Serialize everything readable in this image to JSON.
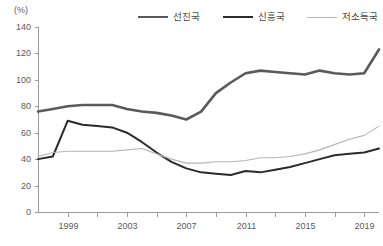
{
  "axis": {
    "unit_label": "(%)",
    "y_ticks": [
      "0",
      "20",
      "40",
      "60",
      "80",
      "100",
      "120",
      "140"
    ],
    "x_ticks": [
      "1999",
      "2003",
      "2007",
      "2011",
      "2015",
      "2019"
    ]
  },
  "legend": {
    "entries": [
      {
        "label": "선진국",
        "color": "#5a5a5a",
        "width": 2.6,
        "icon": "line-swatch-icon"
      },
      {
        "label": "신흥국",
        "color": "#2b2b2b",
        "width": 2.6,
        "icon": "line-swatch-icon"
      },
      {
        "label": "저소득국",
        "color": "#b5b5b5",
        "width": 1.1,
        "icon": "line-swatch-icon"
      }
    ]
  },
  "chart_data": {
    "type": "line",
    "title": "",
    "subtitle": "",
    "xlabel": "",
    "ylabel": "(%)",
    "xlim": [
      1997,
      2020
    ],
    "ylim": [
      0,
      140
    ],
    "grid": false,
    "legend_position": "top",
    "x": [
      1997,
      1998,
      1999,
      2000,
      2001,
      2002,
      2003,
      2004,
      2005,
      2006,
      2007,
      2008,
      2009,
      2010,
      2011,
      2012,
      2013,
      2014,
      2015,
      2016,
      2017,
      2018,
      2019,
      2020
    ],
    "x_tick_values": [
      1999,
      2003,
      2007,
      2011,
      2015,
      2019
    ],
    "x_minor_tick_values": [
      1999,
      2001,
      2003,
      2005,
      2007,
      2009,
      2011,
      2013,
      2015,
      2017,
      2019
    ],
    "y_tick_values": [
      0,
      20,
      40,
      60,
      80,
      100,
      120,
      140
    ],
    "series": [
      {
        "name": "선진국",
        "color": "#5a5a5a",
        "width": 2.6,
        "values": [
          76,
          78,
          80,
          81,
          81,
          81,
          78,
          76,
          75,
          73,
          70,
          76,
          90,
          98,
          105,
          107,
          106,
          105,
          104,
          107,
          105,
          104,
          105,
          123
        ]
      },
      {
        "name": "신흥국",
        "color": "#2b2b2b",
        "width": 2.0,
        "values": [
          40,
          42,
          69,
          66,
          65,
          64,
          60,
          53,
          45,
          38,
          33,
          30,
          29,
          28,
          31,
          30,
          32,
          34,
          37,
          40,
          43,
          44,
          45,
          48
        ]
      },
      {
        "name": "저소득국",
        "color": "#b5b5b5",
        "width": 1.1,
        "values": [
          42,
          45,
          46,
          46,
          46,
          46,
          47,
          48,
          44,
          40,
          37,
          37,
          38,
          38,
          39,
          41,
          41,
          42,
          44,
          47,
          51,
          55,
          58,
          65
        ]
      }
    ]
  }
}
